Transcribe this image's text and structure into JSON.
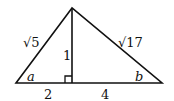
{
  "diagram": {
    "type": "triangle-with-altitude",
    "labels": {
      "left_side": "√5",
      "right_side": "√17",
      "altitude": "1",
      "left_angle": "a",
      "right_angle": "b",
      "left_base_segment": "2",
      "right_base_segment": "4"
    },
    "colors": {
      "stroke": "#111111",
      "background": "#ffffff"
    }
  }
}
